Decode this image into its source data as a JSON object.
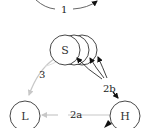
{
  "diagram": {
    "nodes": [
      {
        "id": "S",
        "label": "S"
      },
      {
        "id": "L",
        "label": "L"
      },
      {
        "id": "H",
        "label": "H"
      }
    ],
    "edges": [
      {
        "id": "1",
        "label": "1",
        "from": "",
        "to": "",
        "style": "dark"
      },
      {
        "id": "2a",
        "label": "2a",
        "from": "H",
        "to": "L",
        "style": "gray"
      },
      {
        "id": "2b",
        "label": "2b",
        "from": "H",
        "to": "S",
        "style": "black"
      },
      {
        "id": "3",
        "label": "3",
        "from": "S",
        "to": "L",
        "style": "gray"
      }
    ],
    "colors": {
      "black_edge": "#111111",
      "gray_edge": "#c8c8c8",
      "node_stroke": "#333333"
    }
  }
}
